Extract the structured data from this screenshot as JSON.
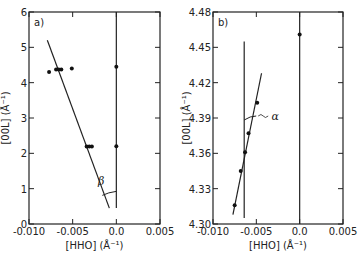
{
  "chart_data": [
    {
      "type": "scatter",
      "panel_label": "a)",
      "xlabel": "[HHO] (Å⁻¹)",
      "ylabel": "[00L] (Å⁻¹)",
      "xlim": [
        -0.01,
        0.005
      ],
      "ylim": [
        0,
        6
      ],
      "x_ticks": [
        -0.01,
        -0.005,
        0.0,
        0.005
      ],
      "x_tick_labels": [
        "-0.010",
        "-0.005",
        "0.0",
        "0.005"
      ],
      "y_ticks": [
        0,
        1,
        2,
        3,
        4,
        5,
        6
      ],
      "y_tick_labels": [
        "0",
        "1",
        "2",
        "3",
        "4",
        "5",
        "6"
      ],
      "points": [
        {
          "x": -0.0077,
          "y": 4.3
        },
        {
          "x": -0.0069,
          "y": 4.37
        },
        {
          "x": -0.0066,
          "y": 4.37
        },
        {
          "x": -0.0063,
          "y": 4.37
        },
        {
          "x": -0.0051,
          "y": 4.4
        },
        {
          "x": 0.0,
          "y": 4.45
        },
        {
          "x": -0.0034,
          "y": 2.19
        },
        {
          "x": -0.0031,
          "y": 2.19
        },
        {
          "x": -0.0028,
          "y": 2.19
        },
        {
          "x": 0.0,
          "y": 2.2
        }
      ],
      "lines": [
        {
          "name": "fit-line",
          "x": [
            -0.0079,
            -0.0008
          ],
          "y": [
            5.2,
            0.45
          ]
        },
        {
          "name": "vertical-reference",
          "x": [
            0.0,
            0.0
          ],
          "y": [
            0.45,
            6
          ]
        }
      ],
      "annotations": [
        {
          "text": "β",
          "x": -0.0014,
          "y": 1.15
        }
      ],
      "grid": false
    },
    {
      "type": "scatter",
      "panel_label": "b)",
      "xlabel": "[HHO] (Å⁻¹)",
      "ylabel": "[00L] (Å⁻¹)",
      "xlim": [
        -0.01,
        0.005
      ],
      "ylim": [
        4.3,
        4.48
      ],
      "x_ticks": [
        -0.01,
        -0.005,
        0.0,
        0.005
      ],
      "x_tick_labels": [
        "-0.010",
        "-0.005",
        "0.0",
        "0.005"
      ],
      "y_ticks": [
        4.3,
        4.33,
        4.36,
        4.39,
        4.42,
        4.45,
        4.48
      ],
      "y_tick_labels": [
        "4.30",
        "4.33",
        "4.36",
        "4.39",
        "4.42",
        "4.45",
        "4.48"
      ],
      "points": [
        {
          "x": 0.0,
          "y": 4.461
        },
        {
          "x": -0.0049,
          "y": 4.403
        },
        {
          "x": -0.0059,
          "y": 4.377
        },
        {
          "x": -0.0063,
          "y": 4.361
        },
        {
          "x": -0.0068,
          "y": 4.345
        },
        {
          "x": -0.0075,
          "y": 4.316
        }
      ],
      "lines": [
        {
          "name": "fit-line",
          "x": [
            -0.0077,
            -0.0044
          ],
          "y": [
            4.308,
            4.428
          ]
        },
        {
          "name": "vertical-reference",
          "x": [
            -0.0064,
            -0.0064
          ],
          "y": [
            4.305,
            4.455
          ]
        },
        {
          "name": "zero-line",
          "x": [
            0.0,
            0.0
          ],
          "y": [
            4.3,
            4.48
          ]
        }
      ],
      "annotations": [
        {
          "text": "α",
          "x": -0.0037,
          "y": 4.39
        }
      ],
      "grid": false
    }
  ]
}
